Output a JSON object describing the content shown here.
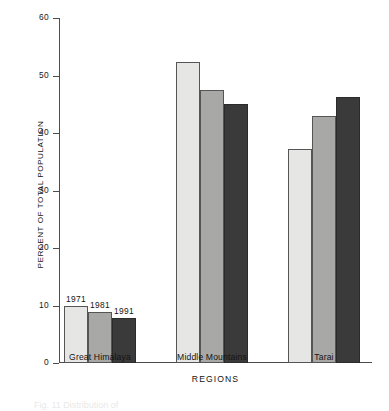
{
  "chart_data": {
    "type": "bar",
    "title": "",
    "xlabel": "REGIONS",
    "ylabel": "PERCENT OF TOTAL POPULATION",
    "categories": [
      "Great Himalaya",
      "Middle Mountains",
      "Tarai"
    ],
    "series": [
      {
        "name": "1971",
        "values": [
          10.0,
          52.3,
          37.3
        ]
      },
      {
        "name": "1981",
        "values": [
          8.8,
          47.4,
          43.0
        ]
      },
      {
        "name": "1991",
        "values": [
          7.8,
          45.0,
          46.2
        ]
      }
    ],
    "ylim": [
      0,
      60
    ],
    "yticks": [
      0,
      10,
      20,
      30,
      40,
      50,
      60
    ],
    "ytick_labels": [
      "0",
      "10",
      "20",
      "30",
      "40",
      "50",
      "60"
    ],
    "grid": false,
    "legend": "inline-year-labels-above-first-group",
    "colors": {
      "1971": "#e6e6e4",
      "1981": "#a8a8a6",
      "1991": "#3a3a3a",
      "axis": "#4d4d4d",
      "text": "#141414",
      "background": "#ffffff"
    }
  },
  "caption": "Fig. 11  Distribution of"
}
